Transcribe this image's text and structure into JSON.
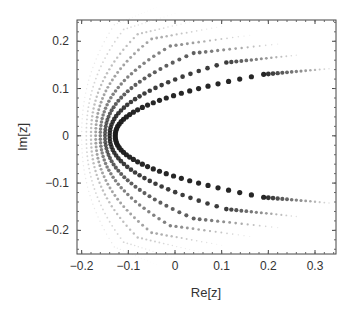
{
  "chart_data": {
    "type": "scatter",
    "title": "",
    "xlabel": "Re[z]",
    "ylabel": "Im[z]",
    "xlim": [
      -0.21,
      0.345
    ],
    "ylim": [
      -0.25,
      0.245
    ],
    "xticks": [
      -0.2,
      -0.1,
      0,
      0.1,
      0.2,
      0.3
    ],
    "xtick_labels": [
      "−0.2",
      "−0.1",
      "0",
      "0.1",
      "0.2",
      "0.3"
    ],
    "yticks": [
      -0.2,
      -0.1,
      0,
      0.1,
      0.2
    ],
    "ytick_labels": [
      "−0.2",
      "−0.1",
      "0",
      "0.1",
      "0.2"
    ],
    "grid": false,
    "legend": null,
    "series": [
      {
        "name": "arc-1",
        "inner_re": -0.128,
        "arm_end": [
          0.19,
          0.13
        ],
        "tail_re": 0.33,
        "opacity": 0.95
      },
      {
        "name": "arc-2",
        "inner_re": -0.14,
        "arm_end": [
          0.11,
          0.155
        ],
        "tail_re": 0.26,
        "opacity": 0.85
      },
      {
        "name": "arc-3",
        "inner_re": -0.15,
        "arm_end": [
          0.04,
          0.175
        ],
        "tail_re": 0.22,
        "opacity": 0.7
      },
      {
        "name": "arc-4",
        "inner_re": -0.16,
        "arm_end": [
          -0.01,
          0.19
        ],
        "tail_re": 0.16,
        "opacity": 0.55
      },
      {
        "name": "arc-5",
        "inner_re": -0.17,
        "arm_end": [
          -0.05,
          0.205
        ],
        "tail_re": 0.1,
        "opacity": 0.4
      },
      {
        "name": "arc-6",
        "inner_re": -0.18,
        "arm_end": [
          -0.08,
          0.215
        ],
        "tail_re": 0.05,
        "opacity": 0.28
      },
      {
        "name": "arc-7",
        "inner_re": -0.19,
        "arm_end": [
          -0.11,
          0.225
        ],
        "tail_re": 0.0,
        "opacity": 0.18
      },
      {
        "name": "arc-8",
        "inner_re": -0.2,
        "arm_end": [
          -0.13,
          0.235
        ],
        "tail_re": -0.04,
        "opacity": 0.1
      }
    ]
  },
  "plot_frame": {
    "left": 77,
    "top": 20,
    "right": 336,
    "bottom": 254
  },
  "colors": {
    "frame": "#444444",
    "dots": "#1a1a1a",
    "text": "#333333"
  }
}
